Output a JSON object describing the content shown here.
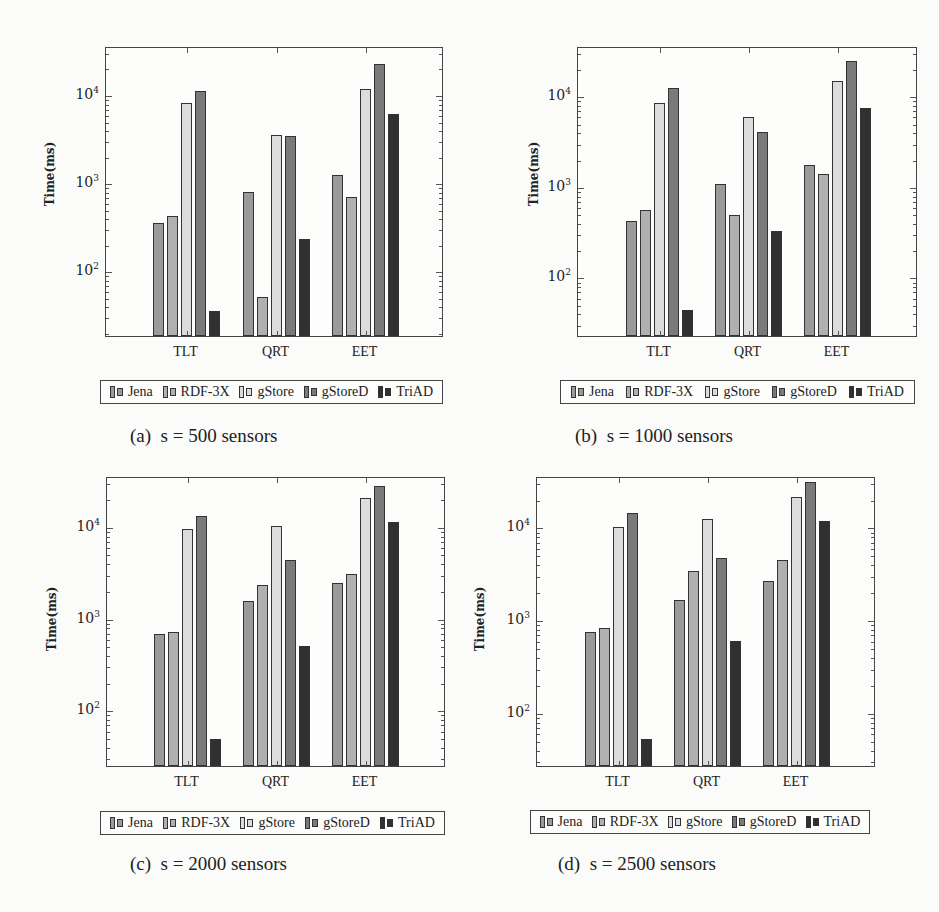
{
  "series_styles": [
    {
      "name": "Jena",
      "color": "#9a9a9a"
    },
    {
      "name": "RDF-3X",
      "color": "#b0b0b0"
    },
    {
      "name": "gStore",
      "color": "#dcdcdc"
    },
    {
      "name": "gStoreD",
      "color": "#7a7a7a"
    },
    {
      "name": "TriAD",
      "color": "#303030"
    }
  ],
  "ylabel": "Time(ms)",
  "ytick_labels": [
    "10",
    "10",
    "10"
  ],
  "ytick_exps": [
    "4",
    "3",
    "2"
  ],
  "categories": [
    "TLT",
    "QRT",
    "EET"
  ],
  "panels": [
    {
      "caption": "(a)  s = 500 sensors"
    },
    {
      "caption": "(b)  s = 1000 sensors"
    },
    {
      "caption": "(c)  s = 2000 sensors"
    },
    {
      "caption": "(d)  s = 2500 sensors"
    }
  ],
  "chart_data": [
    {
      "type": "bar",
      "title": "(a) s = 500 sensors",
      "xlabel": "",
      "ylabel": "Time(ms)",
      "yscale": "log",
      "ylim": [
        18,
        35000
      ],
      "yticks": [
        100,
        1000,
        10000
      ],
      "categories": [
        "TLT",
        "QRT",
        "EET"
      ],
      "legend_position": "bottom",
      "series": [
        {
          "name": "Jena",
          "values": [
            340,
            770,
            1200
          ]
        },
        {
          "name": "RDF-3X",
          "values": [
            410,
            50,
            680
          ]
        },
        {
          "name": "gStore",
          "values": [
            7900,
            3400,
            11500
          ]
        },
        {
          "name": "gStoreD",
          "values": [
            10800,
            3300,
            22000
          ]
        },
        {
          "name": "TriAD",
          "values": [
            35,
            225,
            6000
          ]
        }
      ]
    },
    {
      "type": "bar",
      "title": "(b) s = 1000 sensors",
      "xlabel": "",
      "ylabel": "Time(ms)",
      "yscale": "log",
      "ylim": [
        22,
        35000
      ],
      "yticks": [
        100,
        1000,
        10000
      ],
      "categories": [
        "TLT",
        "QRT",
        "EET"
      ],
      "legend_position": "bottom",
      "series": [
        {
          "name": "Jena",
          "values": [
            410,
            1050,
            1700
          ]
        },
        {
          "name": "RDF-3X",
          "values": [
            540,
            480,
            1350
          ]
        },
        {
          "name": "gStore",
          "values": [
            8300,
            5800,
            14500
          ]
        },
        {
          "name": "gStoreD",
          "values": [
            12000,
            3900,
            24000
          ]
        },
        {
          "name": "TriAD",
          "values": [
            43,
            315,
            7300
          ]
        }
      ]
    },
    {
      "type": "bar",
      "title": "(c) s = 2000 sensors",
      "xlabel": "",
      "ylabel": "Time(ms)",
      "yscale": "log",
      "ylim": [
        24,
        35000
      ],
      "yticks": [
        100,
        1000,
        10000
      ],
      "categories": [
        "TLT",
        "QRT",
        "EET"
      ],
      "legend_position": "bottom",
      "series": [
        {
          "name": "Jena",
          "values": [
            660,
            1500,
            2400
          ]
        },
        {
          "name": "RDF-3X",
          "values": [
            700,
            2250,
            3000
          ]
        },
        {
          "name": "gStore",
          "values": [
            9300,
            10000,
            20000
          ]
        },
        {
          "name": "gStoreD",
          "values": [
            12800,
            4200,
            27000
          ]
        },
        {
          "name": "TriAD",
          "values": [
            47,
            490,
            11000
          ]
        }
      ]
    },
    {
      "type": "bar",
      "title": "(d) s = 2500 sensors",
      "xlabel": "",
      "ylabel": "Time(ms)",
      "yscale": "log",
      "ylim": [
        26,
        35000
      ],
      "yticks": [
        100,
        1000,
        10000
      ],
      "categories": [
        "TLT",
        "QRT",
        "EET"
      ],
      "legend_position": "bottom",
      "series": [
        {
          "name": "Jena",
          "values": [
            730,
            1600,
            2600
          ]
        },
        {
          "name": "RDF-3X",
          "values": [
            810,
            3300,
            4300
          ]
        },
        {
          "name": "gStore",
          "values": [
            9800,
            12000,
            21000
          ]
        },
        {
          "name": "gStoreD",
          "values": [
            14000,
            4600,
            30000
          ]
        },
        {
          "name": "TriAD",
          "values": [
            51,
            580,
            11500
          ]
        }
      ]
    }
  ]
}
